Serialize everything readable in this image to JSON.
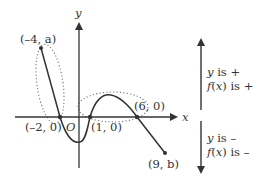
{
  "axes": {
    "x_label": "x",
    "y_label": "y",
    "origin_label": "O"
  },
  "points": [
    {
      "label": "(–4, a)",
      "name": "point-neg4-a"
    },
    {
      "label": "(–2, 0)",
      "name": "point-neg2-0"
    },
    {
      "label": "(1, 0)",
      "name": "point-1-0"
    },
    {
      "label": "(6, 0)",
      "name": "point-6-0"
    },
    {
      "label": "(9, b)",
      "name": "point-9-b"
    }
  ],
  "legend": {
    "positive": {
      "line1": "y is +",
      "line2": "f(x) is +"
    },
    "negative": {
      "line1": "y is –",
      "line2": "f(x) is –"
    }
  },
  "colors": {
    "ink": "#333333",
    "dotted": "#777777"
  }
}
